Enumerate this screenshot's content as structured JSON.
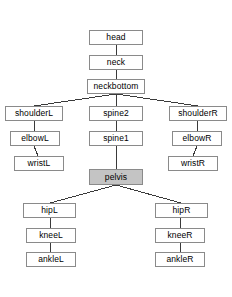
{
  "diagram": {
    "type": "tree",
    "background_color": "#ffffff",
    "node_border_color": "#8a8a8a",
    "node_fill_color": "#ffffff",
    "highlight_fill_color": "#c4c4c4",
    "edge_color": "#3a3a3a",
    "nodes": [
      {
        "id": "head",
        "label": "head",
        "x": 89,
        "y": 30,
        "w": 54,
        "h": 15,
        "highlight": false
      },
      {
        "id": "neck",
        "label": "neck",
        "x": 89,
        "y": 55,
        "w": 54,
        "h": 15,
        "highlight": false
      },
      {
        "id": "neckbottom",
        "label": "neckbottom",
        "x": 87,
        "y": 79,
        "w": 58,
        "h": 15,
        "highlight": false
      },
      {
        "id": "shoulderL",
        "label": "shoulderL",
        "x": 5,
        "y": 106,
        "w": 58,
        "h": 15,
        "highlight": false
      },
      {
        "id": "elbowL",
        "label": "elbowL",
        "x": 10,
        "y": 131,
        "w": 50,
        "h": 15,
        "highlight": false
      },
      {
        "id": "wristL",
        "label": "wristL",
        "x": 14,
        "y": 156,
        "w": 50,
        "h": 15,
        "highlight": false
      },
      {
        "id": "spine2",
        "label": "spine2",
        "x": 89,
        "y": 106,
        "w": 54,
        "h": 15,
        "highlight": false
      },
      {
        "id": "spine1",
        "label": "spine1",
        "x": 89,
        "y": 131,
        "w": 54,
        "h": 15,
        "highlight": false
      },
      {
        "id": "pelvis",
        "label": "pelvis",
        "x": 89,
        "y": 169,
        "w": 54,
        "h": 16,
        "highlight": true
      },
      {
        "id": "shoulderR",
        "label": "shoulderR",
        "x": 169,
        "y": 106,
        "w": 58,
        "h": 15,
        "highlight": false
      },
      {
        "id": "elbowR",
        "label": "elbowR",
        "x": 172,
        "y": 131,
        "w": 50,
        "h": 15,
        "highlight": false
      },
      {
        "id": "wristR",
        "label": "wristR",
        "x": 168,
        "y": 156,
        "w": 50,
        "h": 15,
        "highlight": false
      },
      {
        "id": "hipL",
        "label": "hipL",
        "x": 23,
        "y": 203,
        "w": 53,
        "h": 15,
        "highlight": false
      },
      {
        "id": "kneeL",
        "label": "kneeL",
        "x": 26,
        "y": 228,
        "w": 50,
        "h": 15,
        "highlight": false
      },
      {
        "id": "ankleL",
        "label": "ankleL",
        "x": 26,
        "y": 252,
        "w": 50,
        "h": 15,
        "highlight": false
      },
      {
        "id": "hipR",
        "label": "hipR",
        "x": 155,
        "y": 203,
        "w": 53,
        "h": 15,
        "highlight": false
      },
      {
        "id": "kneeR",
        "label": "kneeR",
        "x": 155,
        "y": 228,
        "w": 50,
        "h": 15,
        "highlight": false
      },
      {
        "id": "ankleR",
        "label": "ankleR",
        "x": 155,
        "y": 252,
        "w": 50,
        "h": 15,
        "highlight": false
      }
    ],
    "edges": [
      {
        "from": "head",
        "to": "neck",
        "x1": 116,
        "y1": 45,
        "x2": 116,
        "y2": 55
      },
      {
        "from": "neck",
        "to": "neckbottom",
        "x1": 116,
        "y1": 70,
        "x2": 116,
        "y2": 79
      },
      {
        "from": "neckbottom",
        "to": "shoulderL",
        "x1": 116,
        "y1": 94,
        "x2": 34,
        "y2": 106
      },
      {
        "from": "neckbottom",
        "to": "spine2",
        "x1": 116,
        "y1": 94,
        "x2": 116,
        "y2": 106
      },
      {
        "from": "neckbottom",
        "to": "shoulderR",
        "x1": 116,
        "y1": 94,
        "x2": 198,
        "y2": 106
      },
      {
        "from": "shoulderL",
        "to": "elbowL",
        "x1": 34,
        "y1": 121,
        "x2": 34,
        "y2": 131
      },
      {
        "from": "elbowL",
        "to": "wristL",
        "x1": 34,
        "y1": 146,
        "x2": 38,
        "y2": 156
      },
      {
        "from": "spine2",
        "to": "spine1",
        "x1": 116,
        "y1": 121,
        "x2": 116,
        "y2": 131
      },
      {
        "from": "spine1",
        "to": "pelvis",
        "x1": 116,
        "y1": 146,
        "x2": 116,
        "y2": 169
      },
      {
        "from": "shoulderR",
        "to": "elbowR",
        "x1": 198,
        "y1": 121,
        "x2": 197,
        "y2": 131
      },
      {
        "from": "elbowR",
        "to": "wristR",
        "x1": 197,
        "y1": 146,
        "x2": 193,
        "y2": 156
      },
      {
        "from": "pelvis",
        "to": "hipL",
        "x1": 116,
        "y1": 185,
        "x2": 50,
        "y2": 203
      },
      {
        "from": "pelvis",
        "to": "hipR",
        "x1": 116,
        "y1": 185,
        "x2": 181,
        "y2": 203
      },
      {
        "from": "hipL",
        "to": "kneeL",
        "x1": 50,
        "y1": 218,
        "x2": 50,
        "y2": 228
      },
      {
        "from": "kneeL",
        "to": "ankleL",
        "x1": 50,
        "y1": 243,
        "x2": 50,
        "y2": 252
      },
      {
        "from": "hipR",
        "to": "kneeR",
        "x1": 181,
        "y1": 218,
        "x2": 180,
        "y2": 228
      },
      {
        "from": "kneeR",
        "to": "ankleR",
        "x1": 180,
        "y1": 243,
        "x2": 180,
        "y2": 252
      }
    ]
  }
}
